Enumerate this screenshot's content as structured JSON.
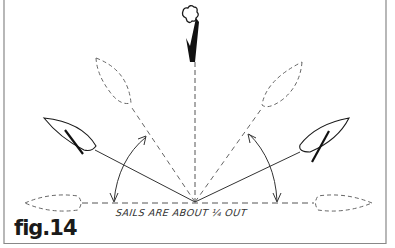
{
  "figure": {
    "label": "fig.14",
    "annotation": "SAILS ARE ABOUT ¼ OUT",
    "wind_indicator": "wind-from-top-arrow",
    "colors": {
      "ink": "#1a1a1a",
      "dashed": "#666666",
      "frame": "#888888",
      "background": "#ffffff"
    },
    "boats": [
      {
        "id": "dashed-upper-left",
        "style": "dashed",
        "heading_deg": 125
      },
      {
        "id": "dashed-upper-right",
        "style": "dashed",
        "heading_deg": 55
      },
      {
        "id": "solid-left",
        "style": "solid",
        "heading_deg": 148
      },
      {
        "id": "solid-right",
        "style": "solid",
        "heading_deg": 32
      },
      {
        "id": "dashed-left-beam",
        "style": "dashed",
        "heading_deg": 180
      },
      {
        "id": "dashed-right-beam",
        "style": "dashed",
        "heading_deg": 0
      }
    ]
  }
}
